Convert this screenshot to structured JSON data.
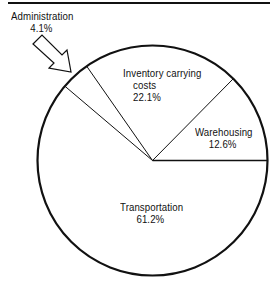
{
  "chart_data": {
    "type": "pie",
    "title": "",
    "categories": [
      "Warehousing",
      "Inventory carrying costs",
      "Administration",
      "Transportation"
    ],
    "values": [
      12.6,
      22.1,
      4.1,
      61.2
    ],
    "unit": "%",
    "start_angle_deg": 0,
    "direction": "counterclockwise",
    "labels": {
      "warehousing": {
        "name": "Warehousing",
        "value": "12.6%"
      },
      "inventory": {
        "name_line1": "Inventory carrying",
        "name_line2": "costs",
        "value": "22.1%"
      },
      "administration": {
        "name": "Administration",
        "value": "4.1%",
        "callout": "hollow-arrow"
      },
      "transportation": {
        "name": "Transportation",
        "value": "61.2%"
      }
    },
    "legend": "none",
    "grid": false,
    "colors": {
      "fill": "#ffffff",
      "stroke": "#111111"
    }
  }
}
